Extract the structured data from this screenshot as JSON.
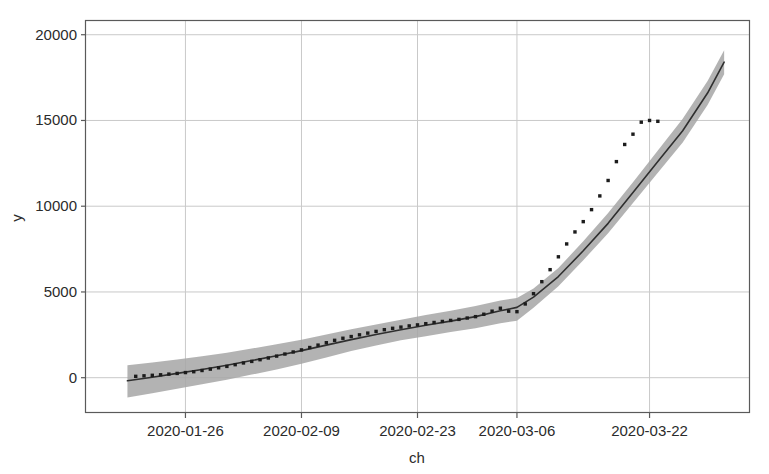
{
  "chart_data": {
    "type": "line",
    "title": "",
    "xlabel": "ch",
    "ylabel": "y",
    "grid": true,
    "legend": "none",
    "ylim": [
      -2000,
      20800
    ],
    "yticks": [
      0,
      5000,
      10000,
      15000,
      20000
    ],
    "ytick_labels": [
      "0",
      "5000",
      "10000",
      "15000",
      "20000"
    ],
    "xtick_labels": [
      "2020-01-26",
      "2020-02-09",
      "2020-02-23",
      "2020-03-06",
      "2020-03-22"
    ],
    "xtick_values": [
      12,
      26,
      40,
      52,
      68
    ],
    "xlim": [
      0,
      80
    ],
    "series": [
      {
        "name": "observed",
        "type": "scatter",
        "marker": "asterisk",
        "color": "#1c1c1c",
        "x": [
          6,
          7,
          8,
          9,
          10,
          11,
          12,
          13,
          14,
          15,
          16,
          17,
          18,
          19,
          20,
          21,
          22,
          23,
          24,
          25,
          26,
          27,
          28,
          29,
          30,
          31,
          32,
          33,
          34,
          35,
          36,
          37,
          38,
          39,
          40,
          41,
          42,
          43,
          44,
          45,
          46,
          47,
          48,
          49,
          50,
          51,
          52,
          53,
          54,
          55,
          56,
          57,
          58,
          59,
          60,
          61,
          62,
          63,
          64,
          65,
          66,
          67,
          68,
          69
        ],
        "y": [
          80,
          110,
          140,
          170,
          210,
          250,
          300,
          350,
          420,
          500,
          580,
          660,
          760,
          860,
          950,
          1050,
          1150,
          1260,
          1380,
          1500,
          1620,
          1760,
          1900,
          2040,
          2180,
          2300,
          2400,
          2500,
          2600,
          2700,
          2800,
          2880,
          2950,
          3020,
          3080,
          3150,
          3220,
          3280,
          3340,
          3400,
          3480,
          3560,
          3700,
          3880,
          4050,
          3880,
          3850,
          4300,
          4900,
          5600,
          6300,
          7050,
          7800,
          8500,
          9100,
          9800,
          10600,
          11500,
          12600,
          13600,
          14200,
          14900,
          15000,
          14950
        ]
      },
      {
        "name": "fitted",
        "type": "line",
        "color": "#2f2f2f",
        "x": [
          5,
          8,
          11,
          14,
          17,
          20,
          23,
          26,
          29,
          32,
          35,
          38,
          41,
          44,
          47,
          50,
          52,
          54,
          57,
          60,
          63,
          66,
          69,
          72,
          75,
          77
        ],
        "y": [
          -180,
          30,
          250,
          480,
          730,
          1000,
          1280,
          1580,
          1900,
          2220,
          2520,
          2800,
          3060,
          3300,
          3560,
          3900,
          4100,
          4700,
          5900,
          7400,
          9000,
          10800,
          12600,
          14400,
          16600,
          18400
        ]
      },
      {
        "name": "confidence-band",
        "type": "area",
        "color": "#a6a6a6",
        "x": [
          5,
          8,
          11,
          14,
          17,
          20,
          23,
          26,
          29,
          32,
          35,
          38,
          41,
          44,
          47,
          50,
          52,
          54,
          57,
          60,
          63,
          66,
          69,
          72,
          75,
          77
        ],
        "upper": [
          720,
          880,
          1060,
          1250,
          1460,
          1700,
          1950,
          2220,
          2520,
          2820,
          3100,
          3380,
          3650,
          3900,
          4180,
          4500,
          4650,
          5200,
          6400,
          7950,
          9600,
          11400,
          13250,
          15100,
          17300,
          19100
        ],
        "lower": [
          -1150,
          -900,
          -640,
          -380,
          -120,
          180,
          480,
          820,
          1180,
          1550,
          1880,
          2180,
          2420,
          2660,
          2880,
          3180,
          3320,
          4080,
          5340,
          6850,
          8420,
          10180,
          11950,
          13720,
          15900,
          17700
        ]
      }
    ]
  },
  "axes": {
    "x_title": "ch",
    "y_title": "y"
  }
}
